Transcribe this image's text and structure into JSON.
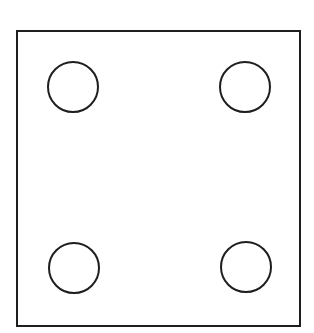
{
  "diagram": {
    "stroke_color": "#1e1e1e",
    "background": "#ffffff",
    "square": {
      "x": 17,
      "y": 31,
      "width": 283,
      "height": 295,
      "stroke_width": 2
    },
    "circles": [
      {
        "position": "top-left",
        "cx": 73,
        "cy": 87,
        "r": 25
      },
      {
        "position": "top-right",
        "cx": 245,
        "cy": 87,
        "r": 25
      },
      {
        "position": "bottom-left",
        "cx": 74,
        "cy": 268,
        "r": 25
      },
      {
        "position": "bottom-right",
        "cx": 246,
        "cy": 267,
        "r": 25
      }
    ]
  }
}
